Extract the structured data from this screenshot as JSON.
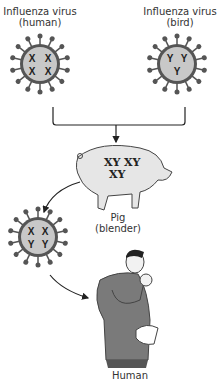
{
  "diagram": {
    "nodes": {
      "virus_human": {
        "title": "Influenza virus",
        "subtitle": "(human)",
        "genes": [
          "X",
          "X",
          "X",
          "X"
        ]
      },
      "virus_bird": {
        "title": "Influenza virus",
        "subtitle": "(bird)",
        "genes": [
          "Y",
          "Y",
          "Y"
        ]
      },
      "pig": {
        "title": "Pig",
        "subtitle": "(blender)",
        "genes": [
          "XY",
          "XY",
          "XY"
        ]
      },
      "virus_reassortant": {
        "genes": [
          "X",
          "X",
          "Y",
          "Y"
        ]
      },
      "human": {
        "title": "Human"
      }
    },
    "edges": [
      {
        "from": "virus_human",
        "to": "pig"
      },
      {
        "from": "virus_bird",
        "to": "pig"
      },
      {
        "from": "pig",
        "to": "virus_reassortant"
      },
      {
        "from": "virus_reassortant",
        "to": "human"
      }
    ],
    "colors": {
      "virus_fill": "#c8c8c8",
      "virus_spikes": "#555555",
      "line": "#222222",
      "pig_fill": "#e6e6e6",
      "shirt": "#7a7a7a"
    }
  }
}
